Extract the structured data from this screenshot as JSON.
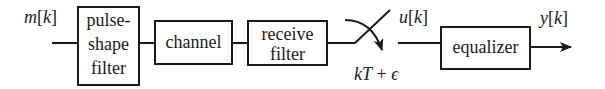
{
  "diagram": {
    "type": "block-diagram",
    "title": "",
    "colors": {
      "stroke": "#1a1a1a",
      "background": "#ffffff"
    },
    "signals": {
      "input": {
        "var": "m",
        "index": "k"
      },
      "sampled": {
        "var": "u",
        "index": "k"
      },
      "output": {
        "var": "y",
        "index": "k"
      },
      "sampling_time": "kT + ϵ"
    },
    "blocks": [
      {
        "id": "pulse-shape-filter",
        "lines": [
          "pulse-",
          "shape",
          "filter"
        ]
      },
      {
        "id": "channel",
        "lines": [
          "channel"
        ]
      },
      {
        "id": "receive-filter",
        "lines": [
          "receive",
          "filter"
        ]
      },
      {
        "id": "equalizer",
        "lines": [
          "equalizer"
        ]
      }
    ],
    "switch": {
      "id": "sampler",
      "label": "kT + ϵ"
    },
    "edges": [
      {
        "from": "m[k]",
        "to": "pulse-shape-filter"
      },
      {
        "from": "pulse-shape-filter",
        "to": "channel"
      },
      {
        "from": "channel",
        "to": "receive-filter"
      },
      {
        "from": "receive-filter",
        "to": "sampler"
      },
      {
        "from": "sampler",
        "to": "equalizer",
        "label": "u[k]"
      },
      {
        "from": "equalizer",
        "to": "y[k]"
      }
    ]
  },
  "labels": {
    "m": "m",
    "u": "u",
    "y": "y",
    "k": "k",
    "lb": "[",
    "rb": "]",
    "kT": "kT",
    "plus": " + ",
    "eps": "ϵ",
    "pulse1": "pulse-",
    "pulse2": "shape",
    "pulse3": "filter",
    "channel": "channel",
    "recv1": "receive",
    "recv2": "filter",
    "equalizer": "equalizer"
  }
}
